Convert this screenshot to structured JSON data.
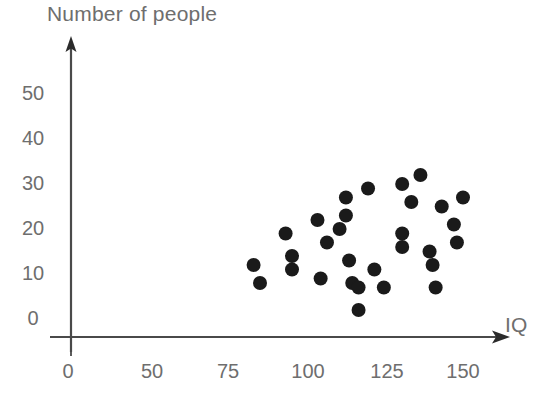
{
  "chart_data": {
    "type": "scatter",
    "title": "",
    "xlabel": "IQ",
    "ylabel": "Number of people",
    "xticks": [
      0,
      50,
      75,
      100,
      125,
      150
    ],
    "yticks": [
      0,
      10,
      20,
      30,
      40,
      50
    ],
    "xlim": [
      0,
      160
    ],
    "ylim": [
      0,
      55
    ],
    "grid": false,
    "legend": null,
    "marker_color": "#1a1a1a",
    "axis_color": "#4a4a4a",
    "label_color": "#6e6e6e",
    "points": [
      {
        "x": 83,
        "y": 16
      },
      {
        "x": 85,
        "y": 12
      },
      {
        "x": 93,
        "y": 23
      },
      {
        "x": 95,
        "y": 18
      },
      {
        "x": 95,
        "y": 15
      },
      {
        "x": 103,
        "y": 26
      },
      {
        "x": 104,
        "y": 13
      },
      {
        "x": 106,
        "y": 21
      },
      {
        "x": 110,
        "y": 24
      },
      {
        "x": 112,
        "y": 31
      },
      {
        "x": 112,
        "y": 27
      },
      {
        "x": 113,
        "y": 17
      },
      {
        "x": 114,
        "y": 12
      },
      {
        "x": 116,
        "y": 11
      },
      {
        "x": 116,
        "y": 6
      },
      {
        "x": 119,
        "y": 33
      },
      {
        "x": 121,
        "y": 15
      },
      {
        "x": 124,
        "y": 11
      },
      {
        "x": 130,
        "y": 34
      },
      {
        "x": 130,
        "y": 23
      },
      {
        "x": 130,
        "y": 20
      },
      {
        "x": 133,
        "y": 30
      },
      {
        "x": 136,
        "y": 36
      },
      {
        "x": 139,
        "y": 19
      },
      {
        "x": 140,
        "y": 16
      },
      {
        "x": 141,
        "y": 11
      },
      {
        "x": 143,
        "y": 29
      },
      {
        "x": 147,
        "y": 25
      },
      {
        "x": 148,
        "y": 21
      },
      {
        "x": 150,
        "y": 31
      }
    ]
  },
  "axes": {
    "x_title": "IQ",
    "y_title": "Number of people",
    "x_tick_labels": [
      "0",
      "50",
      "75",
      "100",
      "125",
      "150"
    ],
    "y_tick_labels": [
      "0",
      "10",
      "20",
      "30",
      "40",
      "50"
    ]
  },
  "geometry": {
    "x_tick_px": [
      68,
      152,
      228,
      308,
      387,
      463
    ],
    "y_tick_px": [
      337,
      292,
      247,
      202,
      157,
      112
    ],
    "origin_px": [
      71,
      337
    ],
    "dot_radius": 7
  }
}
